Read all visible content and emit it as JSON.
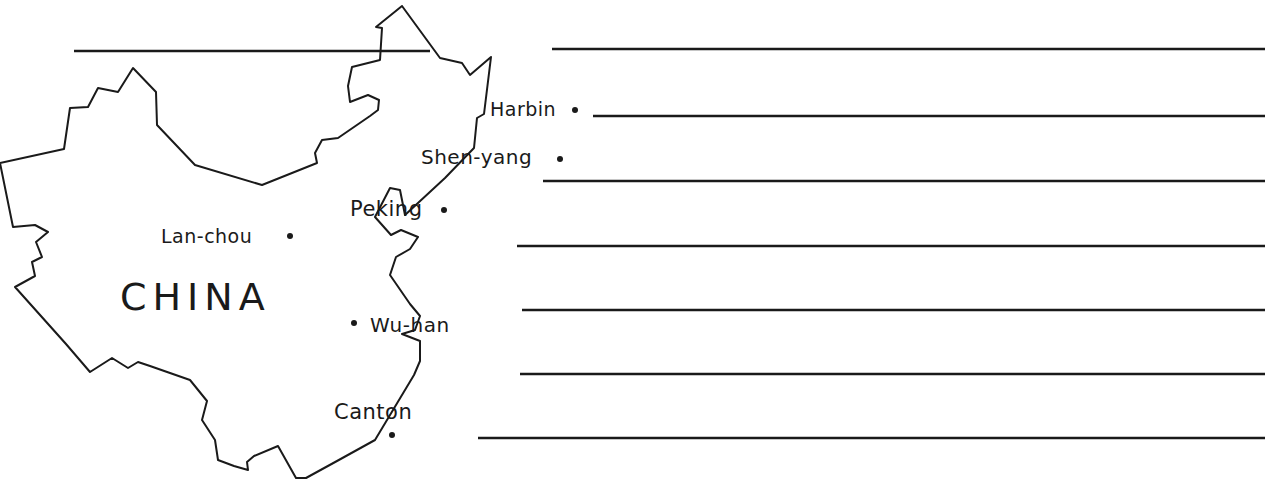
{
  "map": {
    "country": "CHINA",
    "cities": [
      {
        "name": "Harbin"
      },
      {
        "name": "Shen-yang"
      },
      {
        "name": "Peking"
      },
      {
        "name": "Lan-chou"
      },
      {
        "name": "Wu-han"
      },
      {
        "name": "Canton"
      }
    ],
    "ruled_lines": 7,
    "colors": {
      "ink": "#1a1a1a",
      "paper": "#ffffff"
    }
  }
}
